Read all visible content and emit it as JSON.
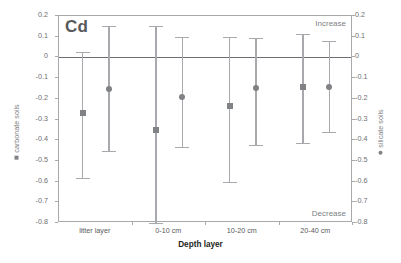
{
  "chart_data": {
    "type": "scatter",
    "title": "Cd",
    "xlabel": "Depth layer",
    "ylabel_left": "carbonate soils",
    "ylabel_right": "silicate soils",
    "ylim": [
      -0.8,
      0.2
    ],
    "yticks": [
      0.2,
      0.1,
      0,
      -0.1,
      -0.2,
      -0.3,
      -0.4,
      -0.5,
      -0.6,
      -0.7,
      -0.8
    ],
    "ytick_labels": [
      "0.2",
      "0.1",
      "0",
      "-0.1",
      "-0.2",
      "-0.3",
      "-0.4",
      "-0.5",
      "-0.6",
      "-0.7",
      "-0.8"
    ],
    "categories": [
      "litter layer",
      "0-10 cm",
      "10-20 cm",
      "20-40 cm"
    ],
    "grid": false,
    "zero_line": true,
    "annotations": {
      "top_right": "Increase",
      "bottom_right": "Decrease"
    },
    "legend_position": "axis-labels",
    "series": [
      {
        "name": "carbonate soils",
        "marker": "square",
        "color": "#808285",
        "values": [
          -0.27,
          -0.35,
          -0.235,
          -0.145
        ],
        "error_upper": [
          0.025,
          0.15,
          0.1,
          0.115
        ],
        "error_lower": [
          -0.585,
          -0.8,
          -0.6,
          -0.415
        ]
      },
      {
        "name": "silicate soils",
        "marker": "circle",
        "color": "#808285",
        "values": [
          -0.155,
          -0.19,
          -0.15,
          -0.145
        ],
        "error_upper": [
          0.15,
          0.1,
          0.095,
          0.08
        ],
        "error_lower": [
          -0.45,
          -0.435,
          -0.425,
          -0.36
        ]
      }
    ]
  },
  "colors": {
    "frame": "#a7a9ac",
    "zero_line": "#6d6e71",
    "marker": "#808285",
    "errorbar": "#a7a9ac",
    "text": "#58595b",
    "background": "#ffffff"
  }
}
